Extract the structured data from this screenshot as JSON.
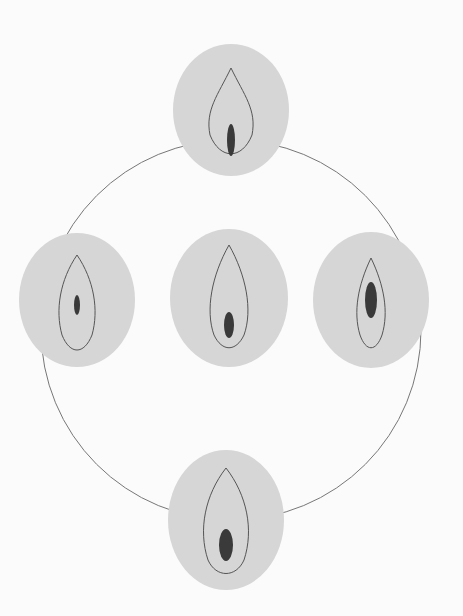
{
  "diagram": {
    "type": "anatomical-variation-diagram",
    "panel_count": 5,
    "panels": [
      {
        "id": "top",
        "position": "top"
      },
      {
        "id": "left",
        "position": "left"
      },
      {
        "id": "center",
        "position": "center"
      },
      {
        "id": "right",
        "position": "right"
      },
      {
        "id": "bottom",
        "position": "bottom"
      }
    ],
    "colors": {
      "background": "#fbfbfb",
      "panel_fill": "#d6d6d6",
      "connector": "#777777",
      "outline": "#555555",
      "shading": "#3a3a3a"
    }
  }
}
